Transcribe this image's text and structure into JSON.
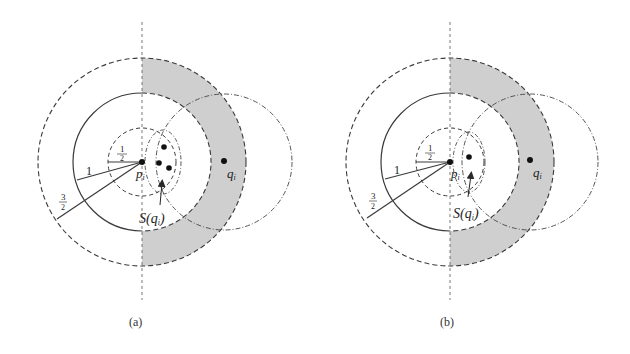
{
  "figure": {
    "panels": [
      {
        "id": "a",
        "caption": "(a)",
        "center_label": "p",
        "center_sub": "i",
        "query_label": "q",
        "query_sub": "i",
        "set_label": "S(q",
        "set_sub": "i",
        "set_close": ")",
        "radius_labels": {
          "half_num": "1",
          "half_den": "2",
          "one": "1",
          "three_half_num": "3",
          "three_half_den": "2"
        },
        "set_point_count": 3
      },
      {
        "id": "b",
        "caption": "(b)",
        "center_label": "p",
        "center_sub": "i",
        "query_label": "q",
        "query_sub": "i",
        "set_label": "S(q",
        "set_sub": "i",
        "set_close": ")",
        "radius_labels": {
          "half_num": "1",
          "half_den": "2",
          "one": "1",
          "three_half_num": "3",
          "three_half_den": "2"
        },
        "set_point_count": 1
      }
    ],
    "colors": {
      "stroke": "#3a3a3a",
      "shade": "#cfcfcf",
      "background": "#ffffff"
    }
  }
}
